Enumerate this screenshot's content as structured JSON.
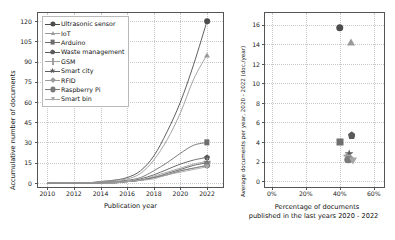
{
  "figure": {
    "panels": [
      "left-line-chart",
      "right-scatter-chart"
    ]
  },
  "legend": {
    "items": [
      {
        "label": "Ultrasonic sensor",
        "marker": "circle",
        "color": "#4d4d4d"
      },
      {
        "label": "IoT",
        "marker": "triangle-up",
        "color": "#9a9a9a"
      },
      {
        "label": "Arduino",
        "marker": "square",
        "color": "#6e6e6e"
      },
      {
        "label": "Waste management",
        "marker": "pentagon",
        "color": "#5a5a5a"
      },
      {
        "label": "GSM",
        "marker": "plus",
        "color": "#9f9f9f"
      },
      {
        "label": "Smart city",
        "marker": "star",
        "color": "#5e5e5e"
      },
      {
        "label": "RFID",
        "marker": "diamond",
        "color": "#9c9c9c"
      },
      {
        "label": "Raspberry Pi",
        "marker": "circle",
        "color": "#7a7a7a"
      },
      {
        "label": "Smart bin",
        "marker": "triangle-down",
        "color": "#a8a8a8"
      }
    ]
  },
  "chart_data": [
    {
      "type": "line",
      "id": "left-line-chart",
      "title": "",
      "xlabel": "Publication year",
      "ylabel": "Accumulative number of documents",
      "xlim": [
        2009.3,
        2023.2
      ],
      "ylim": [
        -3,
        126
      ],
      "xticks": [
        2010,
        2012,
        2014,
        2016,
        2018,
        2020,
        2022
      ],
      "yticks": [
        0,
        15,
        30,
        45,
        60,
        75,
        90,
        105,
        120
      ],
      "grid": true,
      "legend_position": "upper left",
      "x": [
        2010,
        2011,
        2012,
        2013,
        2014,
        2015,
        2016,
        2017,
        2018,
        2019,
        2020,
        2021,
        2022
      ],
      "series": [
        {
          "name": "Ultrasonic sensor",
          "marker": "circle",
          "color": "#4d4d4d",
          "values": [
            0,
            0,
            0,
            0,
            1,
            2,
            4,
            9,
            20,
            38,
            60,
            88,
            120
          ]
        },
        {
          "name": "IoT",
          "marker": "triangle-up",
          "color": "#9a9a9a",
          "values": [
            0,
            0,
            0,
            0,
            1,
            2,
            3,
            7,
            17,
            32,
            52,
            77,
            95
          ]
        },
        {
          "name": "Arduino",
          "marker": "square",
          "color": "#6e6e6e",
          "values": [
            0,
            0,
            0,
            0,
            0,
            1,
            2,
            4,
            9,
            15,
            22,
            28,
            30
          ]
        },
        {
          "name": "Waste management",
          "marker": "pentagon",
          "color": "#5a5a5a",
          "values": [
            0,
            0,
            0,
            0,
            0,
            1,
            1,
            3,
            6,
            10,
            14,
            17,
            19
          ]
        },
        {
          "name": "GSM",
          "marker": "plus",
          "color": "#9f9f9f",
          "values": [
            0,
            0,
            0,
            0,
            0,
            1,
            1,
            2,
            5,
            8,
            11,
            14,
            16
          ]
        },
        {
          "name": "Smart city",
          "marker": "star",
          "color": "#5e5e5e",
          "values": [
            0,
            0,
            0,
            0,
            0,
            0,
            1,
            2,
            4,
            7,
            10,
            13,
            15
          ]
        },
        {
          "name": "RFID",
          "marker": "diamond",
          "color": "#9c9c9c",
          "values": [
            0,
            0,
            0,
            0,
            0,
            0,
            1,
            2,
            4,
            6,
            9,
            11,
            13
          ]
        },
        {
          "name": "Raspberry Pi",
          "marker": "circle",
          "color": "#7a7a7a",
          "values": [
            0,
            0,
            0,
            0,
            0,
            0,
            1,
            2,
            4,
            6,
            9,
            11,
            13
          ]
        },
        {
          "name": "Smart bin",
          "marker": "triangle-down",
          "color": "#a8a8a8",
          "values": [
            0,
            0,
            0,
            0,
            0,
            0,
            1,
            2,
            3,
            6,
            8,
            10,
            12
          ]
        }
      ]
    },
    {
      "type": "scatter",
      "id": "right-scatter-chart",
      "title": "",
      "xlabel": "Percentage of documents\npublished in the last years 2020 - 2022",
      "xlabel_line1": "Percentage of documents",
      "xlabel_line2": "published in the last years 2020 - 2022",
      "ylabel": "Average documents per year, 2020 - 2022 (doc./year)",
      "xlim": [
        -4,
        66
      ],
      "ylim": [
        -0.6,
        17.2
      ],
      "xticks": [
        "0%",
        "20%",
        "40%",
        "60%"
      ],
      "xtick_values": [
        0,
        20,
        40,
        60
      ],
      "yticks": [
        0,
        2,
        4,
        6,
        8,
        10,
        12,
        14,
        16
      ],
      "grid": true,
      "points": [
        {
          "name": "Ultrasonic sensor",
          "x": 40.0,
          "y": 15.7,
          "marker": "circle",
          "color": "#4d4d4d"
        },
        {
          "name": "IoT",
          "x": 46.5,
          "y": 14.2,
          "marker": "triangle-up",
          "color": "#9a9a9a"
        },
        {
          "name": "Waste management",
          "x": 47.0,
          "y": 4.7,
          "marker": "pentagon",
          "color": "#5a5a5a"
        },
        {
          "name": "Arduino",
          "x": 40.2,
          "y": 4.0,
          "marker": "square",
          "color": "#6e6e6e"
        },
        {
          "name": "Smart city",
          "x": 45.5,
          "y": 2.8,
          "marker": "star",
          "color": "#5e5e5e"
        },
        {
          "name": "GSM",
          "x": 44.6,
          "y": 2.5,
          "marker": "plus",
          "color": "#9f9f9f"
        },
        {
          "name": "RFID",
          "x": 46.2,
          "y": 2.4,
          "marker": "diamond",
          "color": "#9c9c9c"
        },
        {
          "name": "Raspberry Pi",
          "x": 45.0,
          "y": 2.2,
          "marker": "circle",
          "color": "#7a7a7a"
        },
        {
          "name": "Smart bin",
          "x": 48.0,
          "y": 2.1,
          "marker": "triangle-down",
          "color": "#a8a8a8"
        }
      ]
    }
  ]
}
